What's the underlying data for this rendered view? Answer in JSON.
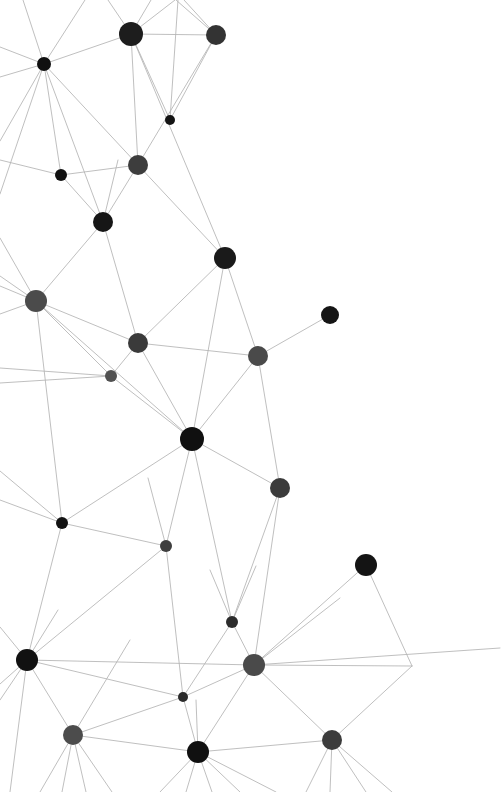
{
  "canvas": {
    "width": 504,
    "height": 792,
    "background": "#ffffff"
  },
  "style": {
    "edge_color": "#b4b4b4",
    "edge_width": 0.9,
    "edge_opacity": 0.95,
    "node_dark": "#131313",
    "node_mid": "#2e2e2e",
    "node_gray": "#4b4b4b"
  },
  "chart_data": {
    "type": "scatter",
    "title": "",
    "subtitle": "",
    "xlabel": "",
    "ylabel": "",
    "xlim": [
      0,
      504
    ],
    "ylim": [
      0,
      792
    ],
    "grid": false,
    "legend": "none",
    "nodes": [
      {
        "id": "n0",
        "x": 131,
        "y": 34,
        "r": 12,
        "color": "#1d1d1d"
      },
      {
        "id": "n1",
        "x": 216,
        "y": 35,
        "r": 10,
        "color": "#333333"
      },
      {
        "id": "n2",
        "x": 44,
        "y": 64,
        "r": 7,
        "color": "#101010"
      },
      {
        "id": "n3",
        "x": 170,
        "y": 120,
        "r": 5,
        "color": "#141414"
      },
      {
        "id": "n4",
        "x": 138,
        "y": 165,
        "r": 10,
        "color": "#3d3d3d"
      },
      {
        "id": "n5",
        "x": 61,
        "y": 175,
        "r": 6,
        "color": "#111111"
      },
      {
        "id": "n6",
        "x": 103,
        "y": 222,
        "r": 10,
        "color": "#161616"
      },
      {
        "id": "n7",
        "x": 225,
        "y": 258,
        "r": 11,
        "color": "#1a1a1a"
      },
      {
        "id": "n8",
        "x": 36,
        "y": 301,
        "r": 11,
        "color": "#4b4b4b"
      },
      {
        "id": "n9",
        "x": 330,
        "y": 315,
        "r": 9,
        "color": "#151515"
      },
      {
        "id": "n10",
        "x": 138,
        "y": 343,
        "r": 10,
        "color": "#3a3a3a"
      },
      {
        "id": "n11",
        "x": 258,
        "y": 356,
        "r": 10,
        "color": "#4a4a4a"
      },
      {
        "id": "n12",
        "x": 111,
        "y": 376,
        "r": 6,
        "color": "#515151"
      },
      {
        "id": "n13",
        "x": 192,
        "y": 439,
        "r": 12,
        "color": "#101010"
      },
      {
        "id": "n14",
        "x": 280,
        "y": 488,
        "r": 10,
        "color": "#3b3b3b"
      },
      {
        "id": "n15",
        "x": 62,
        "y": 523,
        "r": 6,
        "color": "#121212"
      },
      {
        "id": "n16",
        "x": 166,
        "y": 546,
        "r": 6,
        "color": "#3f3f3f"
      },
      {
        "id": "n17",
        "x": 366,
        "y": 565,
        "r": 11,
        "color": "#141414"
      },
      {
        "id": "n18",
        "x": 232,
        "y": 622,
        "r": 6,
        "color": "#2c2c2c"
      },
      {
        "id": "n19",
        "x": 27,
        "y": 660,
        "r": 11,
        "color": "#111111"
      },
      {
        "id": "n20",
        "x": 254,
        "y": 665,
        "r": 11,
        "color": "#4a4a4a"
      },
      {
        "id": "n21",
        "x": 183,
        "y": 697,
        "r": 5,
        "color": "#2b2b2b"
      },
      {
        "id": "n22",
        "x": 73,
        "y": 735,
        "r": 10,
        "color": "#4c4c4c"
      },
      {
        "id": "n23",
        "x": 198,
        "y": 752,
        "r": 11,
        "color": "#101010"
      },
      {
        "id": "n24",
        "x": 332,
        "y": 740,
        "r": 10,
        "color": "#3c3c3c"
      },
      {
        "id": "n25",
        "x": 412,
        "y": 666,
        "r": 0,
        "color": "#b4b4b4"
      }
    ],
    "edges": [
      {
        "source": "n0",
        "target": "n1"
      },
      {
        "source": "n0",
        "target": "n2"
      },
      {
        "source": "n0",
        "target": "n3"
      },
      {
        "source": "n0",
        "target": "n4"
      },
      {
        "source": "n0",
        "target": "n7"
      },
      {
        "source": "n1",
        "target": "n3"
      },
      {
        "source": "n1",
        "target": "n4"
      },
      {
        "source": "n2",
        "target": "n4"
      },
      {
        "source": "n2",
        "target": "n5"
      },
      {
        "source": "n2",
        "target": "n6"
      },
      {
        "source": "n4",
        "target": "n5"
      },
      {
        "source": "n4",
        "target": "n6"
      },
      {
        "source": "n4",
        "target": "n7"
      },
      {
        "source": "n5",
        "target": "n6"
      },
      {
        "source": "n6",
        "target": "n8"
      },
      {
        "source": "n6",
        "target": "n10"
      },
      {
        "source": "n7",
        "target": "n10"
      },
      {
        "source": "n7",
        "target": "n11"
      },
      {
        "source": "n7",
        "target": "n13"
      },
      {
        "source": "n8",
        "target": "n10"
      },
      {
        "source": "n8",
        "target": "n12"
      },
      {
        "source": "n8",
        "target": "n13"
      },
      {
        "source": "n8",
        "target": "n15"
      },
      {
        "source": "n9",
        "target": "n11"
      },
      {
        "source": "n10",
        "target": "n11"
      },
      {
        "source": "n10",
        "target": "n12"
      },
      {
        "source": "n10",
        "target": "n13"
      },
      {
        "source": "n11",
        "target": "n13"
      },
      {
        "source": "n11",
        "target": "n14"
      },
      {
        "source": "n12",
        "target": "n13"
      },
      {
        "source": "n13",
        "target": "n14"
      },
      {
        "source": "n13",
        "target": "n15"
      },
      {
        "source": "n13",
        "target": "n16"
      },
      {
        "source": "n13",
        "target": "n18"
      },
      {
        "source": "n14",
        "target": "n18"
      },
      {
        "source": "n14",
        "target": "n20"
      },
      {
        "source": "n15",
        "target": "n16"
      },
      {
        "source": "n15",
        "target": "n19"
      },
      {
        "source": "n16",
        "target": "n19"
      },
      {
        "source": "n16",
        "target": "n21"
      },
      {
        "source": "n17",
        "target": "n20"
      },
      {
        "source": "n17",
        "target": "n25"
      },
      {
        "source": "n18",
        "target": "n20"
      },
      {
        "source": "n18",
        "target": "n21"
      },
      {
        "source": "n19",
        "target": "n20"
      },
      {
        "source": "n19",
        "target": "n21"
      },
      {
        "source": "n19",
        "target": "n22"
      },
      {
        "source": "n20",
        "target": "n21"
      },
      {
        "source": "n20",
        "target": "n23"
      },
      {
        "source": "n20",
        "target": "n24"
      },
      {
        "source": "n20",
        "target": "n25"
      },
      {
        "source": "n21",
        "target": "n22"
      },
      {
        "source": "n21",
        "target": "n23"
      },
      {
        "source": "n22",
        "target": "n23"
      },
      {
        "source": "n23",
        "target": "n24"
      },
      {
        "source": "n24",
        "target": "n25"
      }
    ],
    "open_edges": [
      {
        "x1": 44,
        "y1": 64,
        "x2": 85,
        "y2": 0
      },
      {
        "x1": 44,
        "y1": 64,
        "x2": 23,
        "y2": 0
      },
      {
        "x1": 44,
        "y1": 64,
        "x2": 0,
        "y2": 47
      },
      {
        "x1": 44,
        "y1": 64,
        "x2": 0,
        "y2": 77
      },
      {
        "x1": 44,
        "y1": 64,
        "x2": 0,
        "y2": 141
      },
      {
        "x1": 44,
        "y1": 64,
        "x2": 0,
        "y2": 194
      },
      {
        "x1": 131,
        "y1": 34,
        "x2": 108,
        "y2": 0
      },
      {
        "x1": 131,
        "y1": 34,
        "x2": 151,
        "y2": 0
      },
      {
        "x1": 131,
        "y1": 34,
        "x2": 175,
        "y2": 0
      },
      {
        "x1": 216,
        "y1": 35,
        "x2": 184,
        "y2": 0
      },
      {
        "x1": 216,
        "y1": 35,
        "x2": 176,
        "y2": 0
      },
      {
        "x1": 170,
        "y1": 120,
        "x2": 178,
        "y2": 0
      },
      {
        "x1": 61,
        "y1": 175,
        "x2": 0,
        "y2": 160
      },
      {
        "x1": 36,
        "y1": 301,
        "x2": 0,
        "y2": 276
      },
      {
        "x1": 36,
        "y1": 301,
        "x2": 0,
        "y2": 286
      },
      {
        "x1": 36,
        "y1": 301,
        "x2": 0,
        "y2": 314
      },
      {
        "x1": 36,
        "y1": 301,
        "x2": 0,
        "y2": 238
      },
      {
        "x1": 111,
        "y1": 376,
        "x2": 0,
        "y2": 383
      },
      {
        "x1": 111,
        "y1": 376,
        "x2": 0,
        "y2": 368
      },
      {
        "x1": 62,
        "y1": 523,
        "x2": 0,
        "y2": 471
      },
      {
        "x1": 62,
        "y1": 523,
        "x2": 0,
        "y2": 500
      },
      {
        "x1": 27,
        "y1": 660,
        "x2": 0,
        "y2": 627
      },
      {
        "x1": 27,
        "y1": 660,
        "x2": 0,
        "y2": 684
      },
      {
        "x1": 27,
        "y1": 660,
        "x2": 0,
        "y2": 700
      },
      {
        "x1": 27,
        "y1": 660,
        "x2": 10,
        "y2": 792
      },
      {
        "x1": 27,
        "y1": 660,
        "x2": 58,
        "y2": 610
      },
      {
        "x1": 73,
        "y1": 735,
        "x2": 40,
        "y2": 792
      },
      {
        "x1": 73,
        "y1": 735,
        "x2": 62,
        "y2": 792
      },
      {
        "x1": 73,
        "y1": 735,
        "x2": 86,
        "y2": 792
      },
      {
        "x1": 73,
        "y1": 735,
        "x2": 112,
        "y2": 792
      },
      {
        "x1": 73,
        "y1": 735,
        "x2": 130,
        "y2": 640
      },
      {
        "x1": 198,
        "y1": 752,
        "x2": 160,
        "y2": 792
      },
      {
        "x1": 198,
        "y1": 752,
        "x2": 186,
        "y2": 792
      },
      {
        "x1": 198,
        "y1": 752,
        "x2": 212,
        "y2": 792
      },
      {
        "x1": 198,
        "y1": 752,
        "x2": 240,
        "y2": 792
      },
      {
        "x1": 198,
        "y1": 752,
        "x2": 276,
        "y2": 792
      },
      {
        "x1": 198,
        "y1": 752,
        "x2": 196,
        "y2": 700
      },
      {
        "x1": 332,
        "y1": 740,
        "x2": 306,
        "y2": 792
      },
      {
        "x1": 332,
        "y1": 740,
        "x2": 330,
        "y2": 792
      },
      {
        "x1": 332,
        "y1": 740,
        "x2": 366,
        "y2": 792
      },
      {
        "x1": 332,
        "y1": 740,
        "x2": 392,
        "y2": 792
      },
      {
        "x1": 232,
        "y1": 622,
        "x2": 210,
        "y2": 570
      },
      {
        "x1": 232,
        "y1": 622,
        "x2": 256,
        "y2": 566
      },
      {
        "x1": 254,
        "y1": 665,
        "x2": 340,
        "y2": 598
      },
      {
        "x1": 254,
        "y1": 665,
        "x2": 500,
        "y2": 648
      },
      {
        "x1": 166,
        "y1": 546,
        "x2": 148,
        "y2": 478
      },
      {
        "x1": 103,
        "y1": 222,
        "x2": 118,
        "y2": 160
      }
    ]
  }
}
